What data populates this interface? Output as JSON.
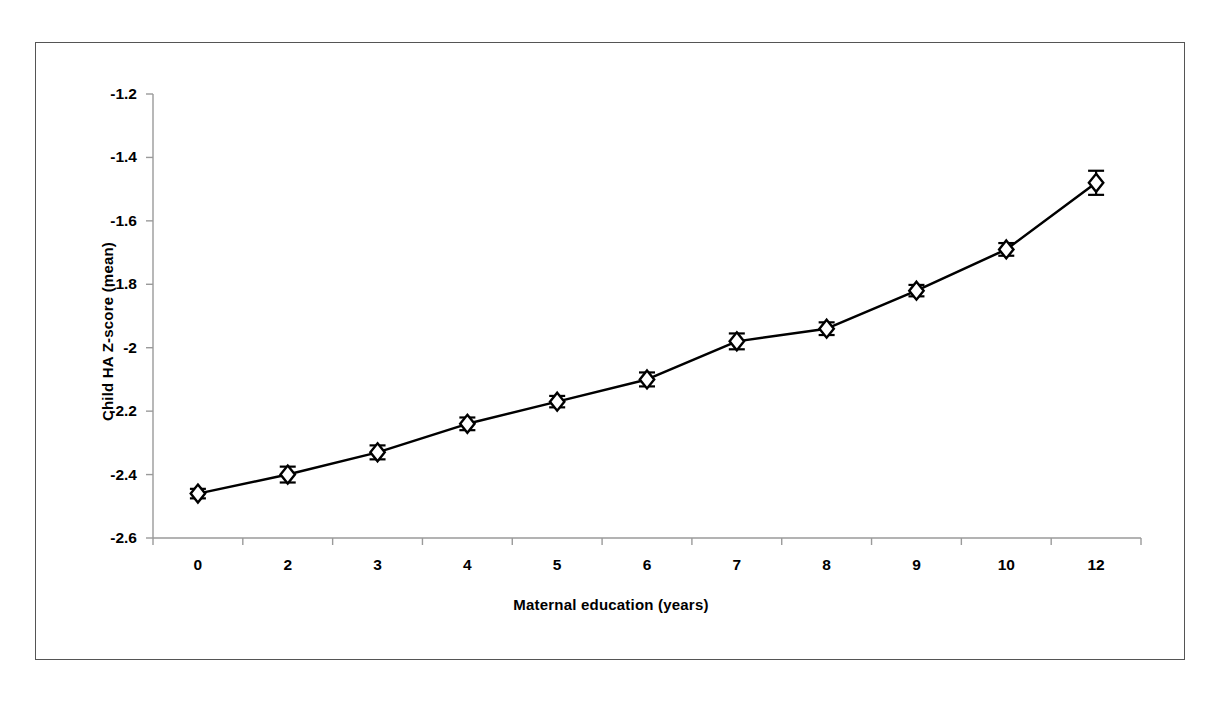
{
  "chart_data": {
    "type": "line",
    "title": "",
    "xlabel": "Maternal education (years)",
    "ylabel": "Child HA Z-score (mean)",
    "categories": [
      "0",
      "2",
      "3",
      "4",
      "5",
      "6",
      "7",
      "8",
      "9",
      "10",
      "12"
    ],
    "values": [
      -2.46,
      -2.4,
      -2.33,
      -2.24,
      -2.17,
      -2.1,
      -1.98,
      -1.94,
      -1.82,
      -1.69,
      -1.48
    ],
    "error_bars": [
      0.015,
      0.025,
      0.022,
      0.02,
      0.018,
      0.022,
      0.025,
      0.02,
      0.018,
      0.02,
      0.038
    ],
    "ylim": [
      -2.6,
      -1.2
    ],
    "y_ticks": [
      "-1.2",
      "-1.4",
      "-1.6",
      "-1.8",
      "-2",
      "-2.2",
      "-2.4",
      "-2.6"
    ],
    "y_tick_values": [
      -1.2,
      -1.4,
      -1.6,
      -1.8,
      -2.0,
      -2.2,
      -2.4,
      -2.6
    ],
    "grid": false,
    "legend": "none",
    "marker": "diamond",
    "series_color": "#000000",
    "line_width": 2.5,
    "marker_size": 9
  },
  "figure": {
    "border_color": "#555555",
    "background": "#ffffff",
    "axis_color": "#000000"
  }
}
